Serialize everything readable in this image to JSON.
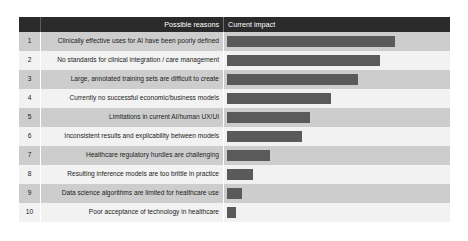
{
  "table": {
    "headers": {
      "number": "",
      "reason": "Possible reasons",
      "impact": "Current impact"
    },
    "rows": [
      {
        "number": "1",
        "reason": "Clinically effective uses for AI have been poorly defined",
        "bar_width_px": 168
      },
      {
        "number": "2",
        "reason": "No standards for clinical integration / care management",
        "bar_width_px": 153
      },
      {
        "number": "3",
        "reason": "Large, annotated training sets are difficult to create",
        "bar_width_px": 131
      },
      {
        "number": "4",
        "reason": "Currently no successful economic/business models",
        "bar_width_px": 104
      },
      {
        "number": "5",
        "reason": "Limitations in current AI/human UX/UI",
        "bar_width_px": 83
      },
      {
        "number": "6",
        "reason": "Inconsistent results and explicability between models",
        "bar_width_px": 75
      },
      {
        "number": "7",
        "reason": "Healthcare regulatory hurdles are challenging",
        "bar_width_px": 43
      },
      {
        "number": "8",
        "reason": "Resulting inference models are too brittle in practice",
        "bar_width_px": 26
      },
      {
        "number": "9",
        "reason": "Data science algorithms are limited for healthcare use",
        "bar_width_px": 15
      },
      {
        "number": "10",
        "reason": "Poor acceptance of technology in healthcare",
        "bar_width_px": 9
      }
    ]
  },
  "chart_data": {
    "type": "bar",
    "title": "Current impact",
    "xlabel": "Current impact",
    "ylabel": "Possible reasons",
    "orientation": "horizontal",
    "grid": false,
    "legend": null,
    "categories": [
      "Clinically effective uses for AI have been poorly defined",
      "No standards for clinical integration / care management",
      "Large, annotated training sets are difficult to create",
      "Currently no successful economic/business models",
      "Limitations in current AI/human UX/UI",
      "Inconsistent results and explicability between models",
      "Healthcare regulatory hurdles are challenging",
      "Resulting inference models are too brittle in practice",
      "Data science algorithms are limited for healthcare use",
      "Poor acceptance of technology in healthcare"
    ],
    "values": [
      168,
      153,
      131,
      104,
      83,
      75,
      43,
      26,
      15,
      9
    ],
    "value_unit": "relative bar length (px)",
    "xlim": [
      0,
      180
    ]
  },
  "colors": {
    "header_background": "#2b2b2b",
    "header_text": "#ffffff",
    "row_odd_background": "#cdcdcd",
    "row_even_background": "#f2f2f2",
    "bar": "#5a5a5a",
    "page_background": "#ffffff"
  }
}
